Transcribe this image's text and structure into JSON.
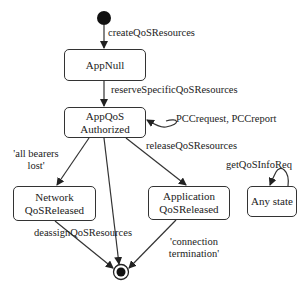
{
  "diagram": {
    "type": "state-machine",
    "states": {
      "app_null": "AppNull",
      "app_qos_authorized": [
        "AppQoS",
        "Authorized"
      ],
      "network_qos_released": [
        "Network",
        "QoSReleased"
      ],
      "application_qos_released": [
        "Application",
        "QoSReleased"
      ],
      "any_state": "Any state"
    },
    "transitions": {
      "create": "createQoSResources",
      "reserve": "reserveSpecificQoSResources",
      "pcc": "PCCrequest, PCCreport",
      "bearers_lost": [
        "'all bearers",
        "lost'"
      ],
      "release": "releaseQoSResources",
      "deassign": "deassignQoSResources",
      "connection_termination": [
        "'connection",
        "termination'"
      ],
      "get_info": "getQoSInfoReq"
    },
    "colors": {
      "stroke": "#333333",
      "text": "#222222",
      "background": "#ffffff"
    }
  }
}
